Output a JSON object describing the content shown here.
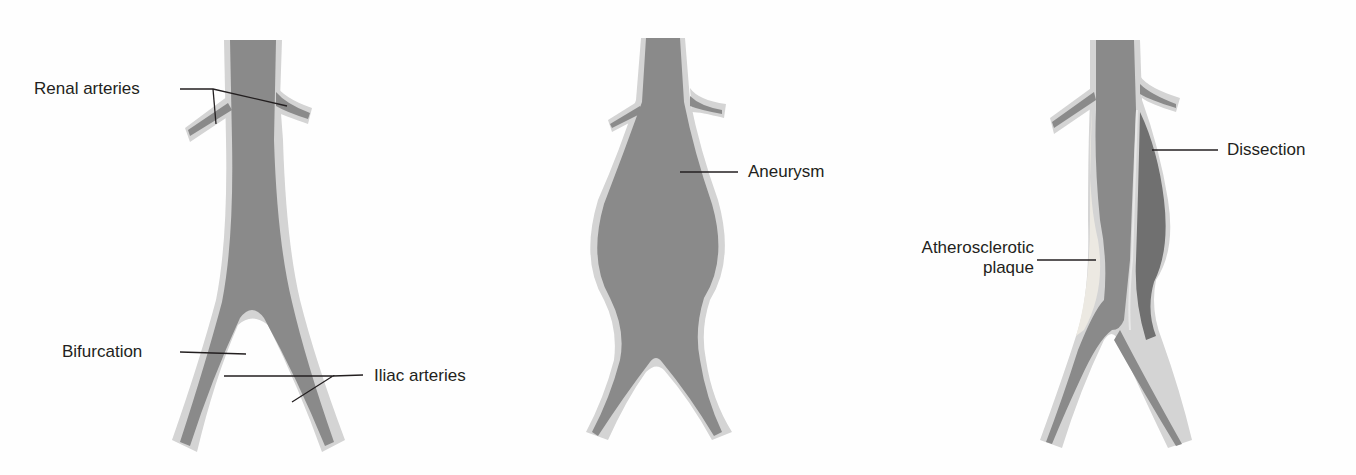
{
  "figure": {
    "panels": [
      {
        "id": "normal",
        "labels": {
          "renal": "Renal arteries",
          "bifurcation": "Bifurcation",
          "iliac": "Iliac arteries"
        }
      },
      {
        "id": "aneurysm",
        "labels": {
          "aneurysm": "Aneurysm"
        }
      },
      {
        "id": "dissection",
        "labels": {
          "dissection": "Dissection",
          "plaque_line1": "Atherosclerotic",
          "plaque_line2": "plaque"
        }
      }
    ],
    "colors": {
      "lumen": "#8a8a8a",
      "wall": "#d4d4d4",
      "plaque": "#e6e6e2",
      "dissection_lumen": "#6f6f6f",
      "leader": "#231f20",
      "text": "#231f20"
    }
  }
}
